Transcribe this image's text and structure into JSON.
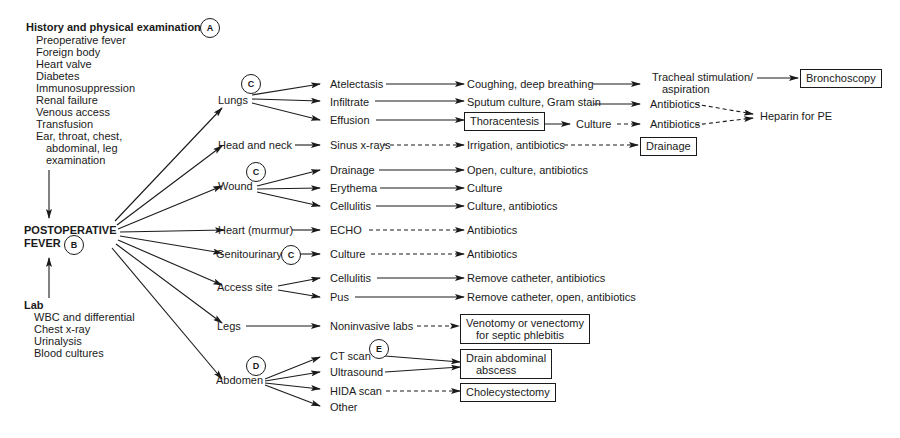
{
  "history": {
    "title": "History and physical examination",
    "marker": "A",
    "items": [
      "Preoperative fever",
      "Foreign body",
      "Heart valve",
      "Diabetes",
      "Immunosuppression",
      "Renal failure",
      "Venous access",
      "Transfusion",
      "Ear, throat, chest,",
      "abdominal, leg",
      "examination"
    ]
  },
  "center": {
    "line1": "POSTOPERATIVE",
    "line2": "FEVER",
    "marker": "B"
  },
  "lab": {
    "title": "Lab",
    "items": [
      "WBC and differential",
      "Chest x-ray",
      "Urinalysis",
      "Blood cultures"
    ]
  },
  "sites": {
    "lungs": "Lungs",
    "lungs_marker": "C",
    "head": "Head and neck",
    "wound": "Wound",
    "wound_marker": "C",
    "heart": "Heart (murmur)",
    "gu": "Genitourinary",
    "gu_marker": "C",
    "access": "Access site",
    "legs": "Legs",
    "abdomen": "Abdomen",
    "abdomen_marker": "D"
  },
  "findings": {
    "atelectasis": "Atelectasis",
    "infiltrate": "Infiltrate",
    "effusion": "Effusion",
    "sinus": "Sinus x-rays",
    "drainage": "Drainage",
    "erythema": "Erythema",
    "cellulitis_w": "Cellulitis",
    "echo": "ECHO",
    "culture_gu": "Culture",
    "cellulitis_a": "Cellulitis",
    "pus": "Pus",
    "noninvasive": "Noninvasive labs",
    "ct": "CT scan",
    "ct_marker": "E",
    "us": "Ultrasound",
    "hida": "HIDA scan",
    "other": "Other"
  },
  "actions": {
    "coughing": "Coughing, deep breathing",
    "sputum": "Sputum culture, Gram stain",
    "thoracentesis": "Thoracentesis",
    "culture_eff": "Culture",
    "irrigation": "Irrigation, antibiotics",
    "open_culture": "Open, culture, antibiotics",
    "culture_ery": "Culture",
    "culture_abx": "Culture, antibiotics",
    "abx_heart": "Antibiotics",
    "abx_gu": "Antibiotics",
    "remove_cath": "Remove catheter, antibiotics",
    "remove_cath_open": "Remove catheter, open, antibiotics",
    "venotomy1": "Venotomy or venectomy",
    "venotomy2": "for septic phlebitis",
    "drain_abd1": "Drain abdominal",
    "drain_abd2": "abscess",
    "chole": "Cholecystectomy"
  },
  "next": {
    "tracheal1": "Tracheal stimulation/",
    "tracheal2": "aspiration",
    "abx1": "Antibiotics",
    "abx2": "Antibiotics",
    "drainage_box": "Drainage",
    "bronch": "Bronchoscopy",
    "heparin": "Heparin for PE"
  }
}
